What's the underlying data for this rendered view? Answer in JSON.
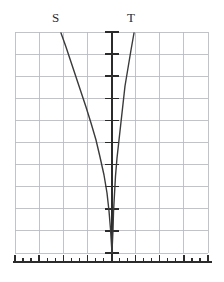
{
  "figure": {
    "name": "two-curve-graph",
    "background_color": "#ffffff",
    "grid_color": "#b9bcc4",
    "axis_color": "#2b2b2b",
    "curve_color": "#3a3a3a"
  },
  "labels": {
    "curve_s": "S",
    "curve_t": "T"
  },
  "chart_data": {
    "type": "line",
    "title": "",
    "xlabel": "",
    "ylabel": "",
    "grid": true,
    "legend": "inline-curve-labels",
    "axis_ranges": {
      "x": [
        -4,
        4
      ],
      "y": [
        0,
        10
      ]
    },
    "plot_box_px": {
      "left": 15,
      "top": 32,
      "right": 208,
      "bottom": 253
    },
    "grid_columns": 8,
    "grid_rows": 10,
    "y_axis": {
      "position_px": 112,
      "x_value": 0,
      "tick_count": 10,
      "tick_half_length_px": 7,
      "tick_values": [
        1,
        2,
        3,
        4,
        5,
        6,
        7,
        8,
        9,
        10
      ]
    },
    "x_axis": {
      "position_px": 262,
      "style": "ruler",
      "major_tick_count": 9,
      "minor_ticks_per_interval": 2,
      "major_tick_length_px": 7,
      "minor_tick_length_px": 4,
      "major_tick_values": [
        -4,
        -3,
        -2,
        -1,
        0,
        1,
        2,
        3,
        4
      ]
    },
    "series": [
      {
        "name": "S",
        "label": "S",
        "label_px": {
          "x": 52,
          "y": 11
        },
        "points_px": [
          [
            61,
            33
          ],
          [
            66,
            47
          ],
          [
            71,
            62
          ],
          [
            76,
            77
          ],
          [
            81,
            92
          ],
          [
            86,
            107
          ],
          [
            91,
            123
          ],
          [
            96,
            140
          ],
          [
            100,
            157
          ],
          [
            104,
            175
          ],
          [
            107,
            193
          ],
          [
            109,
            211
          ],
          [
            110.5,
            229
          ],
          [
            111.5,
            245
          ],
          [
            112,
            253
          ]
        ]
      },
      {
        "name": "T",
        "label": "T",
        "label_px": {
          "x": 127,
          "y": 11
        },
        "points_px": [
          [
            134,
            33
          ],
          [
            131,
            50
          ],
          [
            128,
            68
          ],
          [
            125,
            86
          ],
          [
            123,
            104
          ],
          [
            121,
            122
          ],
          [
            119,
            140
          ],
          [
            117,
            158
          ],
          [
            115.5,
            176
          ],
          [
            114.5,
            194
          ],
          [
            113.5,
            212
          ],
          [
            113,
            230
          ],
          [
            112.3,
            245
          ],
          [
            112,
            253
          ]
        ]
      }
    ]
  }
}
